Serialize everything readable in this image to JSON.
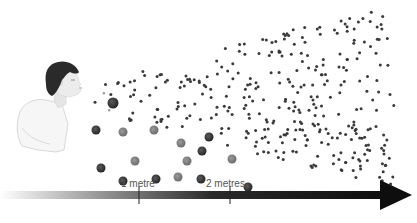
{
  "diagram": {
    "labels": {
      "one_metre": "1 metre",
      "two_metres": "2 metres"
    },
    "arrow": {
      "x_start": 0,
      "x_end": 412,
      "y": 195,
      "gradient_from": "#ffffff",
      "gradient_to": "#111111",
      "tick_positions": [
        139,
        230
      ]
    },
    "colors": {
      "small_droplet": "#3a3a3a",
      "large_droplet_dark": "#333333",
      "large_droplet_mid": "#7a7a7a",
      "hair": "#2a2a2a",
      "skin": "#e8e8e8",
      "shirt": "#f6f6f6"
    },
    "large_droplets": [
      {
        "x": 113,
        "y": 103,
        "r": 5.5,
        "shade": "dark"
      },
      {
        "x": 96,
        "y": 130,
        "r": 4.5,
        "shade": "dark"
      },
      {
        "x": 123,
        "y": 132,
        "r": 4.5,
        "shade": "mid"
      },
      {
        "x": 154,
        "y": 130,
        "r": 4.5,
        "shade": "mid"
      },
      {
        "x": 209,
        "y": 137,
        "r": 4.5,
        "shade": "dark"
      },
      {
        "x": 181,
        "y": 143,
        "r": 4.5,
        "shade": "mid"
      },
      {
        "x": 101,
        "y": 168,
        "r": 4.5,
        "shade": "dark"
      },
      {
        "x": 135,
        "y": 161,
        "r": 4.5,
        "shade": "mid"
      },
      {
        "x": 187,
        "y": 161,
        "r": 4.5,
        "shade": "mid"
      },
      {
        "x": 202,
        "y": 151,
        "r": 4.5,
        "shade": "dark"
      },
      {
        "x": 123,
        "y": 181,
        "r": 4.5,
        "shade": "dark"
      },
      {
        "x": 156,
        "y": 179,
        "r": 4.5,
        "shade": "dark"
      },
      {
        "x": 178,
        "y": 177,
        "r": 4.5,
        "shade": "mid"
      },
      {
        "x": 201,
        "y": 179,
        "r": 4.5,
        "shade": "dark"
      },
      {
        "x": 232,
        "y": 159,
        "r": 4.5,
        "shade": "mid"
      },
      {
        "x": 248,
        "y": 187,
        "r": 4.5,
        "shade": "dark"
      }
    ],
    "small_droplet_cloud": {
      "count": 330,
      "seed": 7,
      "x_min": 95,
      "x_max": 395,
      "y_min": 12,
      "y_max": 185
    }
  }
}
